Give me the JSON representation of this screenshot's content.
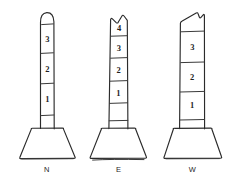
{
  "figure": {
    "background_color": "#ffffff",
    "ink_color": "#2b2b2b",
    "style": "hand-drawn-sketch",
    "columns": [
      {
        "id": "north",
        "label": "N",
        "top_shape": "rounded-dome",
        "segment_count": 3,
        "segments": [
          {
            "label": "3",
            "position": "top"
          },
          {
            "label": "2",
            "position": "middle"
          },
          {
            "label": "1",
            "position": "bottom"
          }
        ],
        "base_shape": "trapezoid"
      },
      {
        "id": "east",
        "label": "E",
        "top_shape": "broken-jagged",
        "segment_count": 4,
        "segments": [
          {
            "label": "4",
            "position": "top"
          },
          {
            "label": "3",
            "position": "upper-middle"
          },
          {
            "label": "2",
            "position": "lower-middle"
          },
          {
            "label": "1",
            "position": "bottom"
          }
        ],
        "base_shape": "trapezoid"
      },
      {
        "id": "west",
        "label": "W",
        "top_shape": "slanted-notched",
        "segment_count": 3,
        "segments": [
          {
            "label": "3",
            "position": "top"
          },
          {
            "label": "2",
            "position": "middle"
          },
          {
            "label": "1",
            "position": "bottom"
          }
        ],
        "base_shape": "trapezoid"
      }
    ]
  }
}
